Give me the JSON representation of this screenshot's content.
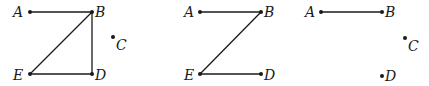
{
  "diagrams": [
    {
      "id": "graph-1",
      "vertices": {
        "A": {
          "label": "A",
          "x": 30,
          "y": 12,
          "lx": 13,
          "ly": 17
        },
        "B": {
          "label": "B",
          "x": 92,
          "y": 12,
          "lx": 95,
          "ly": 17
        },
        "C": {
          "label": "C",
          "x": 113,
          "y": 37,
          "lx": 116,
          "ly": 50
        },
        "D": {
          "label": "D",
          "x": 92,
          "y": 74,
          "lx": 95,
          "ly": 80
        },
        "E": {
          "label": "E",
          "x": 30,
          "y": 74,
          "lx": 13,
          "ly": 80
        }
      },
      "edges": [
        [
          "A",
          "B"
        ],
        [
          "B",
          "E"
        ],
        [
          "B",
          "D"
        ],
        [
          "E",
          "D"
        ]
      ]
    },
    {
      "id": "graph-2",
      "vertices": {
        "A": {
          "label": "A",
          "x": 200,
          "y": 12,
          "lx": 184,
          "ly": 17
        },
        "B": {
          "label": "B",
          "x": 261,
          "y": 12,
          "lx": 264,
          "ly": 17
        },
        "D": {
          "label": "D",
          "x": 261,
          "y": 74,
          "lx": 264,
          "ly": 80
        },
        "E": {
          "label": "E",
          "x": 200,
          "y": 74,
          "lx": 184,
          "ly": 80
        }
      },
      "edges": [
        [
          "A",
          "B"
        ],
        [
          "B",
          "E"
        ],
        [
          "E",
          "D"
        ]
      ]
    },
    {
      "id": "graph-3",
      "vertices": {
        "A": {
          "label": "A",
          "x": 321,
          "y": 12,
          "lx": 305,
          "ly": 17
        },
        "B": {
          "label": "B",
          "x": 382,
          "y": 12,
          "lx": 385,
          "ly": 17
        },
        "C": {
          "label": "C",
          "x": 405,
          "y": 38,
          "lx": 408,
          "ly": 51
        },
        "D": {
          "label": "D",
          "x": 382,
          "y": 76,
          "lx": 385,
          "ly": 81
        }
      },
      "edges": [
        [
          "A",
          "B"
        ]
      ]
    }
  ]
}
